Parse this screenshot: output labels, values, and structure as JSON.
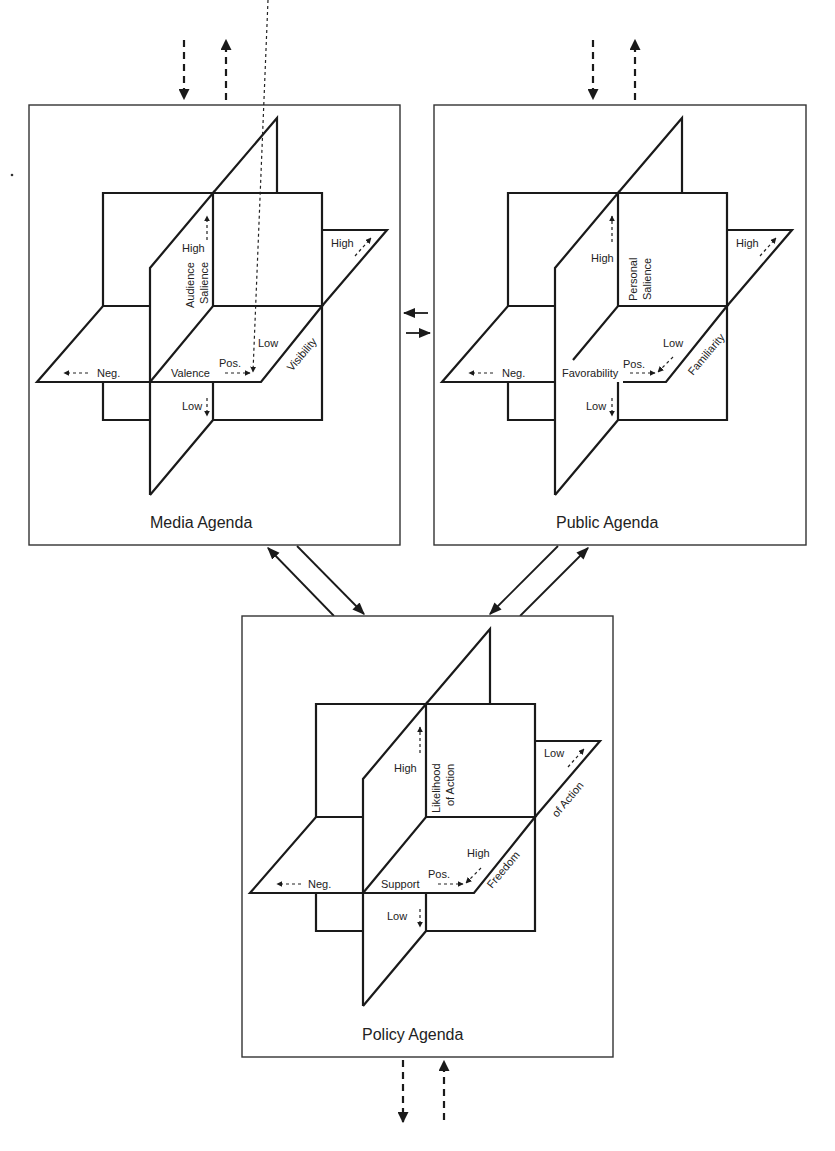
{
  "diagram": {
    "type": "three-agenda planes model",
    "panels": [
      {
        "id": "media",
        "title": "Media Agenda",
        "vertical_axis": {
          "name": "Audience Salience",
          "line1": "Audience",
          "line2": "Salience",
          "high": "High",
          "low": "Low"
        },
        "horizontal_axis": {
          "name": "Valence",
          "neg": "Neg.",
          "pos": "Pos."
        },
        "depth_axis": {
          "name": "Visibility",
          "high": "High",
          "low": "Low"
        }
      },
      {
        "id": "public",
        "title": "Public Agenda",
        "vertical_axis": {
          "name": "Personal Salience",
          "line1": "Personal",
          "line2": "Salience",
          "high": "High",
          "low": "Low"
        },
        "horizontal_axis": {
          "name": "Favorability",
          "neg": "Neg.",
          "pos": "Pos."
        },
        "depth_axis": {
          "name": "Familiarity",
          "high": "High",
          "low": "Low"
        }
      },
      {
        "id": "policy",
        "title": "Policy Agenda",
        "vertical_axis": {
          "name": "Likelihood of Action",
          "line1": "Likelihood",
          "line2": "of Action",
          "high": "High",
          "low": "Low"
        },
        "horizontal_axis": {
          "name": "Support",
          "neg": "Neg.",
          "pos": "Pos."
        },
        "depth_axis": {
          "name": "Freedom of Action",
          "line1": "Freedom",
          "line2": "of Action",
          "high": "High",
          "low": "Low"
        }
      }
    ],
    "connections": [
      {
        "from": "external",
        "to": "media",
        "style": "dashed",
        "direction": "in/out"
      },
      {
        "from": "external",
        "to": "public",
        "style": "dashed",
        "direction": "in/out"
      },
      {
        "from": "media",
        "to": "public",
        "style": "solid",
        "direction": "bidirectional"
      },
      {
        "from": "media",
        "to": "policy",
        "style": "solid",
        "direction": "bidirectional"
      },
      {
        "from": "public",
        "to": "policy",
        "style": "solid",
        "direction": "bidirectional"
      },
      {
        "from": "policy",
        "to": "external",
        "style": "dashed",
        "direction": "in/out"
      }
    ]
  }
}
